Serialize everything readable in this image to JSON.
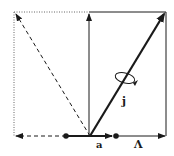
{
  "diagram": {
    "type": "vector-coupling",
    "labels": {
      "j": "j",
      "a": "a",
      "lambda": "Λ"
    },
    "colors": {
      "stroke": "#1a1a1a",
      "dotted": "#666666",
      "background": "#ffffff"
    },
    "elements": [
      "top-dotted-line",
      "left-dotted-line",
      "top-solid-line",
      "right-vertical-line",
      "vertical-arrow",
      "thick-j-arrow",
      "dashed-diagonal-arrow",
      "bottom-dashed-arrow",
      "bottom-a-segment",
      "bottom-lambda-arrow",
      "rotation-ellipse"
    ]
  }
}
